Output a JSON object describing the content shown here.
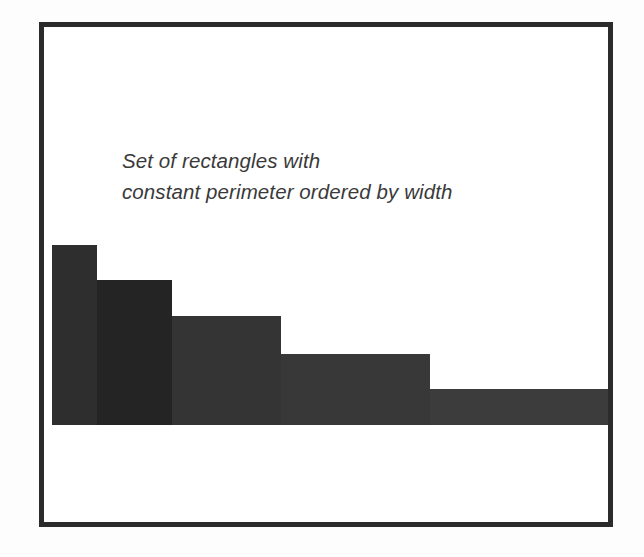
{
  "figure": {
    "background_color": "#ffffff",
    "frame_color": "#2b2b2b",
    "caption_line_1": "Set of rectangles with",
    "caption_line_2": "constant perimeter ordered by width",
    "caption_color": "#3a3a3a"
  },
  "chart_data": {
    "type": "bar",
    "title": "Set of rectangles with constant perimeter ordered by width",
    "subtitle": "",
    "xlabel": "",
    "ylabel": "",
    "grid": false,
    "legend": "none",
    "axis_visible": false,
    "tick_labels_x": [],
    "tick_labels_y": [],
    "categories": [
      "1",
      "2",
      "3",
      "4",
      "5"
    ],
    "values": [
      180,
      145,
      109,
      71,
      36
    ],
    "widths": [
      45,
      75,
      109,
      149,
      185
    ],
    "semi_perimeter": 225,
    "ylim": [
      0,
      225
    ],
    "note": "Each bar is a rectangle whose width + height is constant (half-perimeter = 225 px); bars are adjacent with no gaps and ordered left-to-right by increasing width.",
    "bars": [
      {
        "index": 1,
        "label": "rectangle-1",
        "width": 45,
        "height": 180,
        "x_left": 8,
        "color": "#2e2e2e"
      },
      {
        "index": 2,
        "label": "rectangle-2",
        "width": 75,
        "height": 145,
        "x_left": 53,
        "color": "#242424"
      },
      {
        "index": 3,
        "label": "rectangle-3",
        "width": 109,
        "height": 109,
        "x_left": 128,
        "color": "#343434"
      },
      {
        "index": 4,
        "label": "rectangle-4",
        "width": 149,
        "height": 71,
        "x_left": 237,
        "color": "#383838"
      },
      {
        "index": 5,
        "label": "rectangle-5",
        "width": 185,
        "height": 36,
        "x_left": 386,
        "color": "#3c3c3c"
      }
    ]
  }
}
